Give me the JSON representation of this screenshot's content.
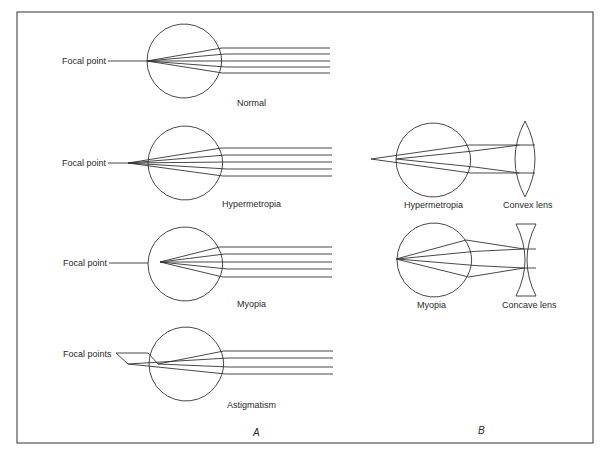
{
  "colors": {
    "line": "#333333",
    "text": "#2a2a2a",
    "background": "#ffffff"
  },
  "frame": {
    "x": 17,
    "y": 12,
    "width": 576,
    "height": 431
  },
  "panel_a": {
    "label": "A",
    "label_pos": [
      253,
      436
    ],
    "eyes": [
      {
        "id": "normal",
        "caption": "Normal",
        "caption_pos": [
          237,
          106
        ],
        "center": [
          184,
          61
        ],
        "r": 37,
        "focal_label": "Focal point",
        "focal_label_pos": [
          62,
          64
        ],
        "leader": [
          [
            108,
            61
          ],
          [
            147,
            61
          ]
        ],
        "focus": [
          147,
          61
        ],
        "ray_ys": [
          48,
          54,
          61,
          67,
          73
        ],
        "ray_enter_x": 222,
        "ray_end_x": 330
      },
      {
        "id": "hypermetropia",
        "caption": "Hypermetropia",
        "caption_pos": [
          222,
          207
        ],
        "center": [
          185,
          163
        ],
        "r": 37,
        "focal_label": "Focal point",
        "focal_label_pos": [
          62,
          166
        ],
        "leader": [
          [
            108,
            163
          ],
          [
            128,
            163
          ]
        ],
        "focus": [
          128,
          163
        ],
        "ray_ys": [
          148,
          155,
          162,
          169,
          176
        ],
        "ray_enter_x": 223,
        "ray_end_x": 332
      },
      {
        "id": "myopia",
        "caption": "Myopia",
        "caption_pos": [
          237,
          307
        ],
        "center": [
          185,
          264
        ],
        "r": 37,
        "focal_label": "Focal point",
        "focal_label_pos": [
          63,
          266
        ],
        "leader": [
          [
            109,
            263
          ],
          [
            148,
            263
          ]
        ],
        "focus": [
          160,
          262
        ],
        "ray_ys": [
          247,
          254,
          262,
          269,
          277
        ],
        "ray_enter_x": 223,
        "ray_end_x": 332
      },
      {
        "id": "astigmatism",
        "caption": "Astigmatism",
        "caption_pos": [
          227,
          408
        ],
        "center": [
          186,
          364
        ],
        "r": 37,
        "focal_label": "Focal points",
        "focal_label_pos": [
          63,
          357
        ],
        "leader_paths": [
          [
            [
              116,
              353
            ],
            [
              148,
              353
            ],
            [
              158,
              364
            ]
          ],
          [
            [
              116,
              353
            ],
            [
              128,
              364
            ]
          ]
        ],
        "foci": [
          [
            158,
            364
          ],
          [
            128,
            364
          ]
        ],
        "ray_ys": [
          351,
          358,
          367,
          374
        ],
        "ray_enter_x": 224,
        "ray_end_x": 333
      }
    ]
  },
  "panel_b": {
    "label": "B",
    "label_pos": [
      478,
      434
    ],
    "items": [
      {
        "id": "hypermetropia-corrected",
        "caption": "Hypermetropia",
        "caption_pos": [
          404,
          208
        ],
        "center": [
          433,
          160
        ],
        "r": 37,
        "focus": [
          371,
          159
        ],
        "eye_left_x": 396,
        "ray_ys": [
          145,
          173
        ],
        "lens_type": "convex",
        "lens_caption": "Convex lens",
        "lens_caption_pos": [
          503,
          208
        ],
        "lens": {
          "cx": 525,
          "top": 121,
          "bottom": 197,
          "half_w": 10
        }
      },
      {
        "id": "myopia-corrected",
        "caption": "Myopia",
        "caption_pos": [
          417,
          308
        ],
        "center": [
          434,
          260
        ],
        "r": 37,
        "focus": [
          396,
          259
        ],
        "eye_left_x": 397,
        "ray_ys": [
          249,
          268
        ],
        "lens_type": "concave",
        "lens_caption": "Concave lens",
        "lens_caption_pos": [
          502,
          308
        ],
        "lens": {
          "cx": 526,
          "top": 224,
          "bottom": 296,
          "half_w": 10,
          "waist": 2
        }
      }
    ]
  }
}
